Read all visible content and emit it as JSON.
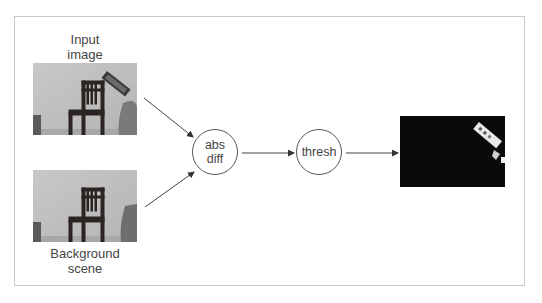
{
  "diagram": {
    "type": "pipeline-flow",
    "inputs": [
      {
        "id": "input-image",
        "label_lines": [
          "Input",
          "image"
        ],
        "image_desc": "grayscale photo of wooden chair against wall with person holding remote/phone at right"
      },
      {
        "id": "background-scene",
        "label_lines": [
          "Background",
          "scene"
        ],
        "image_desc": "grayscale photo of same wooden chair against wall, no foreground object"
      }
    ],
    "nodes": [
      {
        "id": "abs-diff",
        "label_lines": [
          "abs",
          "diff"
        ]
      },
      {
        "id": "thresh",
        "label_lines": [
          "thresh"
        ]
      }
    ],
    "output": {
      "id": "foreground-mask",
      "image_desc": "black image with white segmented foreground object (held remote) at upper right"
    },
    "edges": [
      {
        "from": "input-image",
        "to": "abs-diff"
      },
      {
        "from": "background-scene",
        "to": "abs-diff"
      },
      {
        "from": "abs-diff",
        "to": "thresh"
      },
      {
        "from": "thresh",
        "to": "foreground-mask"
      }
    ],
    "colors": {
      "frame_border": "#c9c9c9",
      "stroke": "#555555",
      "text": "#444444",
      "mask_background": "#0a0a0a"
    }
  }
}
